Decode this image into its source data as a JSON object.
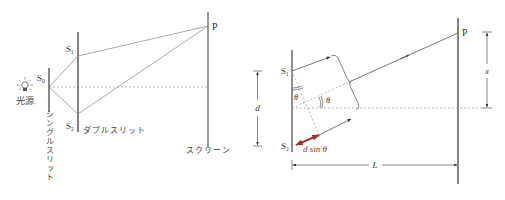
{
  "left_diagram": {
    "title": "Young's double-slit setup",
    "light_source_label": "光源",
    "single_slit_source_label": "S",
    "single_slit_source_sub": "0",
    "single_slit_label": "シングルスリット",
    "double_slit_label": "ダブルスリット",
    "slit1_label": "S",
    "slit1_sub": "1",
    "slit2_label": "S",
    "slit2_sub": "2",
    "point_label": "P",
    "screen_label": "スクリーン",
    "icons": [
      "light-bulb-icon"
    ]
  },
  "right_diagram": {
    "title": "Path difference geometry",
    "slit1_label": "S",
    "slit1_sub": "1",
    "slit2_label": "S",
    "slit2_sub": "2",
    "point_label": "P",
    "slit_separation_label": "d",
    "distance_label": "L",
    "position_label": "x",
    "angle_label_1": "θ",
    "angle_label_2": "θ",
    "path_difference_label": "d sin θ",
    "path_difference_color": "#a0302a"
  },
  "colors": {
    "line": "#333333",
    "ray": "#888888",
    "dashed": "#999999",
    "accent": "#a0302a"
  }
}
